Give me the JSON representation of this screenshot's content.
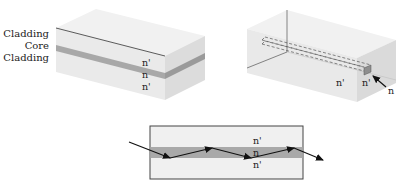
{
  "slab_waveguide": {
    "layer_labels": [
      "Cladding",
      "Core",
      "Cladding"
    ],
    "index_labels": [
      "n'",
      "n",
      "n'"
    ]
  },
  "channel_waveguide": {
    "index_labels": [
      "n'",
      "n'"
    ],
    "core_pointer_label": "n"
  },
  "ray_diagram": {
    "index_labels": [
      "n'",
      "n",
      "n'"
    ]
  },
  "colors": {
    "cladding_light": "#ebebeb",
    "cladding_top": "#f2f2f2",
    "cladding_side": "#dedede",
    "core": "#a9a9a9",
    "line": "#333333"
  }
}
